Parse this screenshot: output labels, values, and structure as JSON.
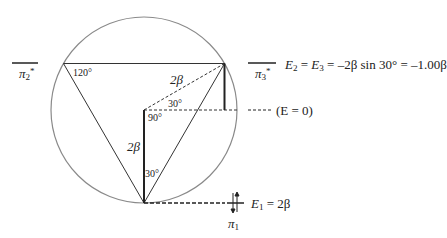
{
  "diagram": {
    "type": "Frost circle / Hückel MO energy diagram (cyclopropenyl)",
    "colors": {
      "circle": "#8a8a8a",
      "lines": "#333333",
      "text": "#222222"
    },
    "angles": {
      "top_left": "120°",
      "center_top": "30°",
      "center_right": "90°",
      "bottom": "30°"
    },
    "segments": {
      "radius_diag": "2β",
      "radius_vert": "2β"
    },
    "levels": {
      "pi2": {
        "symbol": "π",
        "sub": "2",
        "sup": "*"
      },
      "pi3": {
        "symbol": "π",
        "sub": "3",
        "sup": "*"
      },
      "pi1": {
        "symbol": "π",
        "sub": "1"
      }
    },
    "equations": {
      "upper": {
        "lhs1": "E",
        "sub1": "2",
        "eq": " = ",
        "lhs2": "E",
        "sub2": "3",
        "rhs": " = –2β sin 30° = –1.00β"
      },
      "zero": "(E = 0)",
      "lower": {
        "lhs": "E",
        "sub": "1",
        "rhs": " = 2β"
      }
    }
  }
}
